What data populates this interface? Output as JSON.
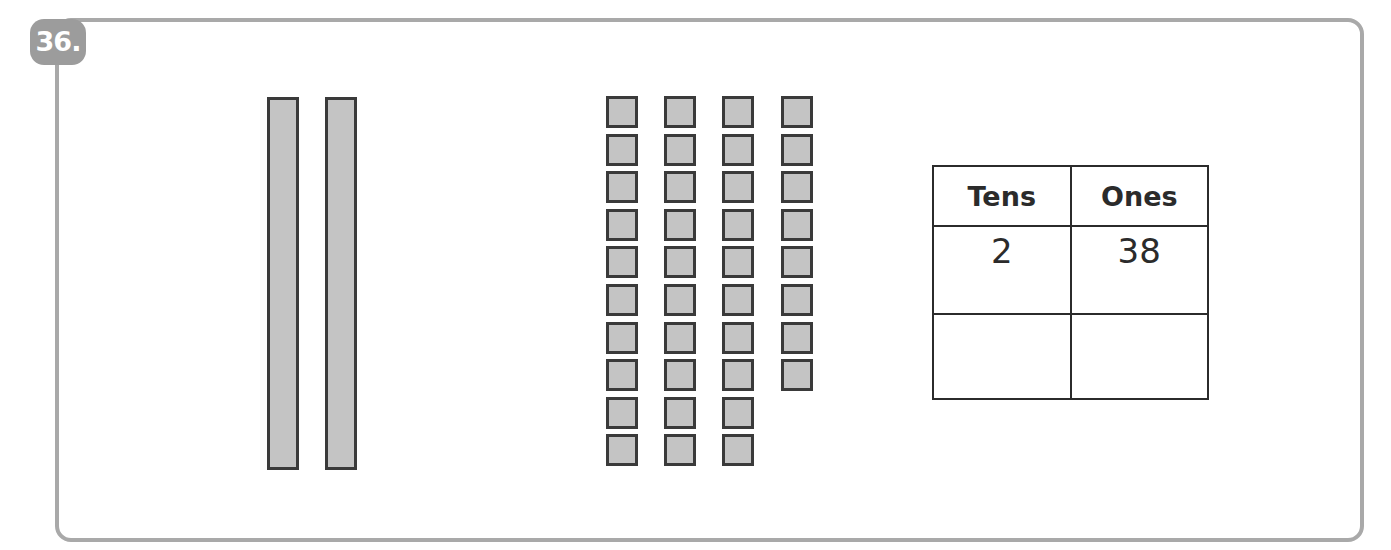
{
  "problem": {
    "number_label": "36."
  },
  "model": {
    "tens_rods": 2,
    "ones_columns": [
      10,
      10,
      10,
      8
    ],
    "total_ones": 38
  },
  "place_value_table": {
    "headers": [
      "Tens",
      "Ones"
    ],
    "rows": [
      [
        "2",
        "38"
      ],
      [
        "",
        ""
      ]
    ]
  },
  "colors": {
    "frame": "#a9a9a9",
    "badge": "#9c9c9c",
    "block_fill": "#c4c4c4",
    "block_border": "#3a3a3a"
  }
}
